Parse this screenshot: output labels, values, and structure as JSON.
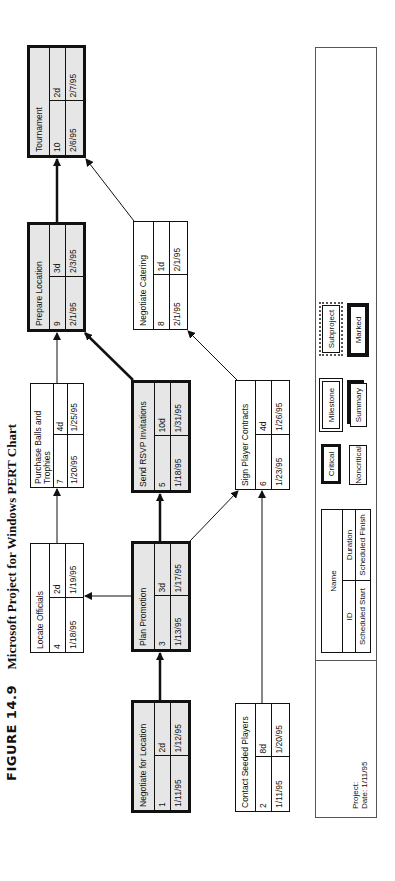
{
  "caption": {
    "figure_label": "FIGURE 14.9",
    "title": "Microsoft Project for Windows PERT Chart"
  },
  "tasks": [
    {
      "id": "1",
      "name": "Negotiate for Location",
      "duration": "2d",
      "start": "1/11/95",
      "finish": "1/12/95",
      "critical": true
    },
    {
      "id": "2",
      "name": "Contact Seeded Players",
      "duration": "8d",
      "start": "1/11/95",
      "finish": "1/20/95",
      "critical": false
    },
    {
      "id": "3",
      "name": "Plan Promotion",
      "duration": "3d",
      "start": "1/13/95",
      "finish": "1/17/95",
      "critical": true
    },
    {
      "id": "4",
      "name": "Locate Officials",
      "duration": "2d",
      "start": "1/18/95",
      "finish": "1/19/95",
      "critical": false
    },
    {
      "id": "5",
      "name": "Send RSVP Invitations",
      "duration": "10d",
      "start": "1/18/95",
      "finish": "1/31/95",
      "critical": true
    },
    {
      "id": "6",
      "name": "Sign Player Contracts",
      "duration": "4d",
      "start": "1/23/95",
      "finish": "1/26/95",
      "critical": false
    },
    {
      "id": "7",
      "name": "Purchase Balls and Trophies",
      "duration": "4d",
      "start": "1/20/95",
      "finish": "1/25/95",
      "critical": false
    },
    {
      "id": "8",
      "name": "Negotiate Catering",
      "duration": "1d",
      "start": "2/1/95",
      "finish": "2/1/95",
      "critical": false
    },
    {
      "id": "9",
      "name": "Prepare Location",
      "duration": "3d",
      "start": "2/1/95",
      "finish": "2/3/95",
      "critical": true
    },
    {
      "id": "10",
      "name": "Tournament",
      "duration": "2d",
      "start": "2/6/95",
      "finish": "2/7/95",
      "critical": true
    }
  ],
  "dependencies": [
    {
      "from": "1",
      "to": "3",
      "critical": true
    },
    {
      "from": "3",
      "to": "5",
      "critical": true
    },
    {
      "from": "3",
      "to": "4",
      "critical": false
    },
    {
      "from": "3",
      "to": "6",
      "critical": false
    },
    {
      "from": "2",
      "to": "6",
      "critical": false
    },
    {
      "from": "4",
      "to": "7",
      "critical": false
    },
    {
      "from": "5",
      "to": "9",
      "critical": true
    },
    {
      "from": "6",
      "to": "8",
      "critical": false
    },
    {
      "from": "7",
      "to": "9",
      "critical": false
    },
    {
      "from": "8",
      "to": "10",
      "critical": false
    },
    {
      "from": "9",
      "to": "10",
      "critical": true
    }
  ],
  "legend": {
    "key": {
      "name": "Name",
      "id": "ID",
      "duration": "Duration",
      "scheduled_start": "Scheduled Start",
      "scheduled_finish": "Scheduled Finish"
    },
    "styles": {
      "critical": "Critical",
      "noncritical": "Noncritical",
      "milestone": "Milestone",
      "summary": "Summary",
      "subproject": "Subproject",
      "marked": "Marked"
    },
    "project_label": "Project:",
    "date_label": "Date: 1/11/95"
  },
  "colors": {
    "critical_fill": "#e6e6e6",
    "line": "#111111",
    "background": "#ffffff"
  }
}
